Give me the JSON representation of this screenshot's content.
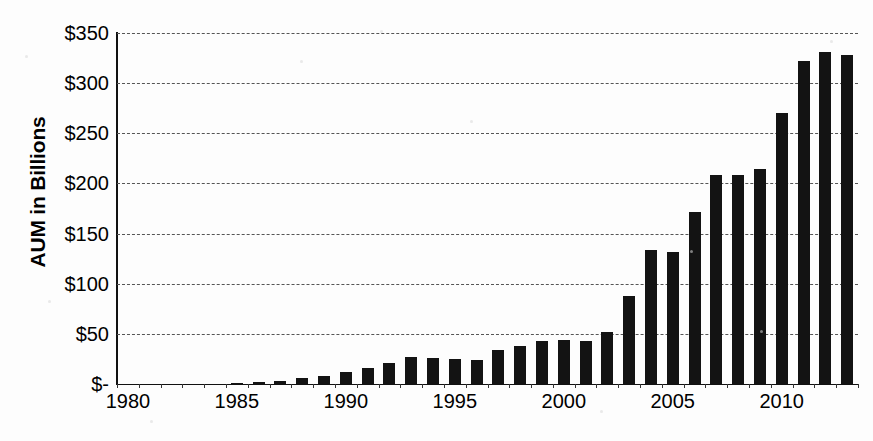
{
  "chart_data": {
    "type": "bar",
    "title": "",
    "xlabel": "",
    "ylabel": "AUM in Billions",
    "ylim": [
      0,
      350
    ],
    "ytick_values": [
      0,
      50,
      100,
      150,
      200,
      250,
      300,
      350
    ],
    "ytick_labels": [
      "$-",
      "$50",
      "$100",
      "$150",
      "$200",
      "$250",
      "$300",
      "$350"
    ],
    "xtick_labels": [
      "1980",
      "1985",
      "1990",
      "1995",
      "2000",
      "2005",
      "2010"
    ],
    "xtick_values": [
      1980,
      1985,
      1990,
      1995,
      2000,
      2005,
      2010
    ],
    "grid": "horizontal-dashed",
    "legend": "none",
    "bar_color": "#131313",
    "categories": [
      1980,
      1981,
      1982,
      1983,
      1984,
      1985,
      1986,
      1987,
      1988,
      1989,
      1990,
      1991,
      1992,
      1993,
      1994,
      1995,
      1996,
      1997,
      1998,
      1999,
      2000,
      2001,
      2002,
      2003,
      2004,
      2005,
      2006,
      2007,
      2008,
      2009,
      2010,
      2011,
      2012,
      2013
    ],
    "values": [
      0,
      0,
      0,
      0,
      0,
      1,
      2,
      3,
      6,
      8,
      12,
      16,
      21,
      27,
      26,
      25,
      24,
      34,
      38,
      43,
      44,
      43,
      52,
      88,
      134,
      132,
      172,
      208,
      208,
      214,
      270,
      322,
      331,
      328
    ]
  },
  "axis": {
    "y_title": "AUM in Billions"
  }
}
